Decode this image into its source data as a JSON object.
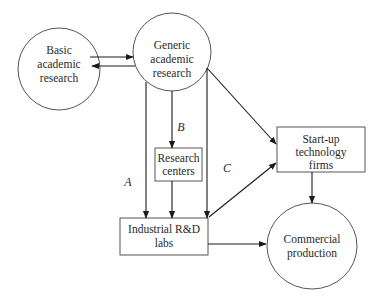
{
  "diagram": {
    "nodes": {
      "basic": {
        "shape": "circle",
        "lines": [
          "Basic",
          "academic",
          "research"
        ]
      },
      "generic": {
        "shape": "circle",
        "lines": [
          "Generic",
          "academic",
          "research"
        ]
      },
      "centers": {
        "shape": "box",
        "lines": [
          "Research",
          "centers"
        ]
      },
      "industrial": {
        "shape": "box",
        "lines": [
          "Industrial R&D",
          "labs"
        ]
      },
      "startup": {
        "shape": "box",
        "lines": [
          "Start-up",
          "technology",
          "firms"
        ]
      },
      "commercial": {
        "shape": "circle",
        "lines": [
          "Commercial",
          "production"
        ]
      }
    },
    "edge_labels": {
      "a": "A",
      "b": "B",
      "c": "C"
    },
    "edges": [
      {
        "from": "basic",
        "to": "generic"
      },
      {
        "from": "generic",
        "to": "basic"
      },
      {
        "from": "generic",
        "to": "centers",
        "label": "B"
      },
      {
        "from": "generic",
        "to": "industrial",
        "label": "A"
      },
      {
        "from": "centers",
        "to": "industrial"
      },
      {
        "from": "generic",
        "to": "industrial"
      },
      {
        "from": "generic",
        "to": "startup"
      },
      {
        "from": "industrial",
        "to": "startup",
        "label": "C"
      },
      {
        "from": "startup",
        "to": "commercial"
      },
      {
        "from": "industrial",
        "to": "commercial"
      }
    ]
  }
}
